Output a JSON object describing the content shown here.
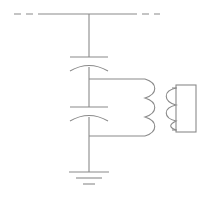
{
  "diagram": {
    "title": "Capacitive voltage divider with coupling transformer",
    "type": "electrical-schematic",
    "canvas": {
      "width": 204,
      "height": 199,
      "background": "#ffffff"
    },
    "style": {
      "line_color": "#8a8a8a",
      "line_width": 1.1,
      "dash_pattern": "7 5"
    },
    "nodes": {
      "bus_y": 14,
      "bus_x_start": 14,
      "bus_x_end": 160,
      "bus_dash_left_end": 44,
      "bus_dash_right_start": 130,
      "main_x": 89,
      "mid_junction_y": 79,
      "low_junction_y": 136,
      "ground_y": 172
    },
    "components": [
      {
        "name": "high-voltage-bus",
        "label": "HV busbar (dashed continuation)",
        "kind": "line",
        "x1": 14,
        "y1": 14,
        "x2": 160,
        "y2": 14
      },
      {
        "name": "capacitor-c1",
        "label": "C1 coupling capacitor",
        "kind": "capacitor-curved",
        "cx": 89,
        "cy": 62,
        "plate_half_width": 19,
        "plate_gap": 9
      },
      {
        "name": "capacitor-c2",
        "label": "C2 divider capacitor",
        "kind": "capacitor-curved",
        "cx": 89,
        "cy": 112,
        "plate_half_width": 19,
        "plate_gap": 9
      },
      {
        "name": "transformer-primary",
        "label": "Primary winding (3 turns)",
        "kind": "coil",
        "x": 145,
        "y_top": 79,
        "y_bottom": 136,
        "turns": 3,
        "bulge": 11,
        "facing": "right"
      },
      {
        "name": "transformer-secondary",
        "label": "Secondary winding (3 turns)",
        "kind": "coil",
        "x": 160,
        "y_top": 88,
        "y_bottom": 130,
        "turns": 3,
        "bulge": 11,
        "facing": "left"
      },
      {
        "name": "load-box",
        "label": "Load / instrument block",
        "kind": "rect",
        "x": 176,
        "y": 85,
        "width": 20,
        "height": 47
      },
      {
        "name": "ground-symbol",
        "label": "Earth ground",
        "kind": "ground",
        "x": 89,
        "y": 172,
        "bars": [
          20,
          13,
          7
        ],
        "bar_gap": 5
      }
    ],
    "wires": [
      {
        "name": "bus-to-c1",
        "x1": 89,
        "y1": 14,
        "x2": 89,
        "y2": 57
      },
      {
        "name": "c1-to-mid",
        "x1": 89,
        "y1": 67,
        "x2": 89,
        "y2": 107
      },
      {
        "name": "c2-to-ground",
        "x1": 89,
        "y1": 117,
        "x2": 89,
        "y2": 172
      },
      {
        "name": "mid-tap-to-primary-top",
        "x1": 89,
        "y1": 79,
        "x2": 145,
        "y2": 79
      },
      {
        "name": "low-tap-to-primary-bottom",
        "x1": 89,
        "y1": 136,
        "x2": 145,
        "y2": 136
      },
      {
        "name": "secondary-top-to-load",
        "x1": 160,
        "y1": 88,
        "x2": 176,
        "y2": 88
      },
      {
        "name": "secondary-bottom-to-load",
        "x1": 160,
        "y1": 130,
        "x2": 176,
        "y2": 130
      }
    ]
  }
}
